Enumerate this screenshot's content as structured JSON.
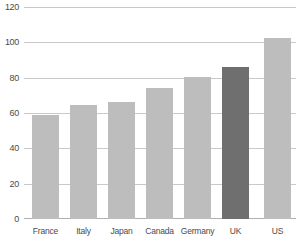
{
  "chart_data": {
    "type": "bar",
    "title": "",
    "subtitle": "",
    "xlabel": "",
    "ylabel": "",
    "categories": [
      "France",
      "Italy",
      "Japan",
      "Canada",
      "Germany",
      "UK",
      "US"
    ],
    "values": [
      59,
      65,
      66.5,
      74.5,
      81,
      86.5,
      103
    ],
    "ylim": [
      0,
      120
    ],
    "yticks": [
      0,
      20,
      40,
      60,
      80,
      100,
      120
    ],
    "ytick_labels": [
      "0",
      "20",
      "40",
      "60",
      "80",
      "100",
      "120"
    ],
    "grid": true,
    "legend": "none",
    "series": [
      {
        "name": "value",
        "values": [
          59,
          65,
          66.5,
          74.5,
          81,
          86.5,
          103
        ]
      }
    ],
    "highlight_category": "UK",
    "colors": {
      "bar_default": "#bdbdbd",
      "bar_highlight": "#6f6f6f",
      "gridline": "#c9c9c9",
      "baseline": "#b0b0b0",
      "tick_text": "#4a4a4a",
      "background": "#ffffff"
    }
  }
}
